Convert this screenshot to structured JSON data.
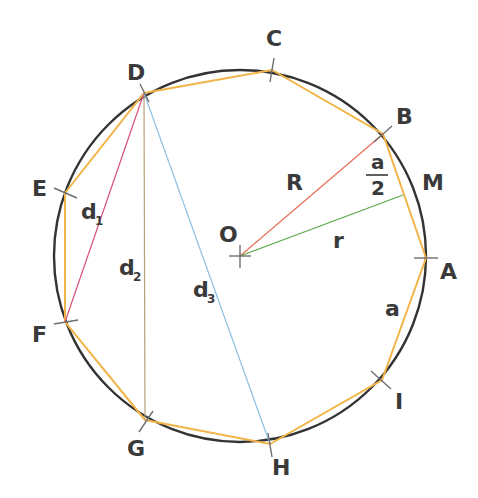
{
  "diagram": {
    "colors": {
      "circle": "#333333",
      "polygon": "#f2b54a",
      "tick": "#6e6e6e",
      "radius_R": "#e8735a",
      "apothem_r": "#5aa84a",
      "diag_d1": "#d9507a",
      "diag_d2": "#b8a07a",
      "diag_d3": "#8fc0e0",
      "label": "#3a3a3a"
    },
    "circle": {
      "cx": 240,
      "cy": 256,
      "r": 186
    },
    "center": {
      "label": "O",
      "x": 240,
      "y": 256
    },
    "vertices": [
      {
        "label": "A",
        "x": 426,
        "y": 258
      },
      {
        "label": "B",
        "x": 383,
        "y": 134
      },
      {
        "label": "C",
        "x": 272,
        "y": 70
      },
      {
        "label": "D",
        "x": 144,
        "y": 93
      },
      {
        "label": "E",
        "x": 65,
        "y": 193
      },
      {
        "label": "F",
        "x": 65,
        "y": 322
      },
      {
        "label": "G",
        "x": 145,
        "y": 420
      },
      {
        "label": "H",
        "x": 270,
        "y": 444
      },
      {
        "label": "I",
        "x": 382,
        "y": 380
      }
    ],
    "midpoint": {
      "label": "M",
      "x": 403,
      "y": 195
    },
    "segments": {
      "R": {
        "label": "R",
        "from": "O",
        "to": "B"
      },
      "r": {
        "label": "r",
        "from": "O",
        "to": "M"
      },
      "a": {
        "label": "a",
        "edge": "A-I"
      },
      "half_a": {
        "numerator": "a",
        "denominator": "2"
      }
    },
    "diagonals": [
      {
        "label": "d",
        "sub": "1",
        "from": "D",
        "to": "F"
      },
      {
        "label": "d",
        "sub": "2",
        "from": "D",
        "to": "G"
      },
      {
        "label": "d",
        "sub": "3",
        "from": "D",
        "to": "H"
      }
    ]
  }
}
